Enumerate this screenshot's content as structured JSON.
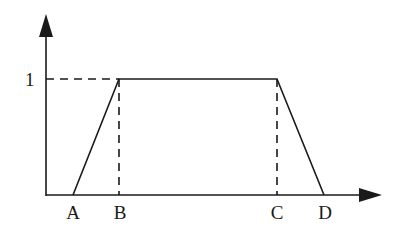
{
  "diagram": {
    "type": "trapezoidal-membership-function",
    "stroke_color": "#1a1a1a",
    "background": "#ffffff",
    "y_axis": {
      "tick_label": "1"
    },
    "x_axis": {
      "labels": [
        "A",
        "B",
        "C",
        "D"
      ]
    },
    "points": {
      "A": {
        "label": "A",
        "x": 73
      },
      "B": {
        "label": "B",
        "x": 119
      },
      "C": {
        "label": "C",
        "x": 277
      },
      "D": {
        "label": "D",
        "x": 324
      }
    }
  }
}
